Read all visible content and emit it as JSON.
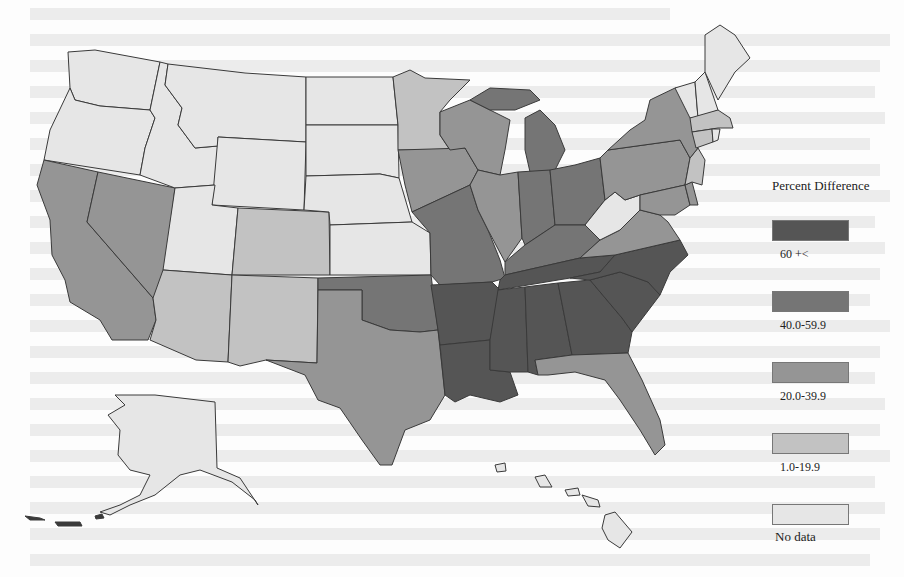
{
  "document": {
    "type": "scanned-page",
    "figure": "choropleth-map-united-states"
  },
  "legend": {
    "title": "Percent Difference",
    "items": [
      {
        "label": "60 +<",
        "color": "#555555",
        "class": "c60"
      },
      {
        "label": "40.0-59.9",
        "color": "#757575",
        "class": "c40"
      },
      {
        "label": "20.0-39.9",
        "color": "#959595",
        "class": "c20"
      },
      {
        "label": "1.0-19.9",
        "color": "#c2c2c2",
        "class": "c1"
      },
      {
        "label": "No data",
        "color": "#e6e6e6",
        "class": "nd"
      }
    ]
  },
  "map": {
    "region": "United States",
    "states": {
      "WA": "No data",
      "OR": "No data",
      "ID": "No data",
      "MT": "No data",
      "WY": "No data",
      "UT": "No data",
      "ND": "No data",
      "SD": "No data",
      "NE": "No data",
      "KS": "No data",
      "WV": "No data",
      "ME": "No data",
      "NH": "No data",
      "VT": "No data",
      "RI": "No data",
      "AK": "No data",
      "HI": "No data",
      "MN": "1.0-19.9",
      "CO": "1.0-19.9",
      "NM": "1.0-19.9",
      "AZ": "1.0-19.9",
      "MA": "1.0-19.9",
      "CT": "1.0-19.9",
      "NJ": "1.0-19.9",
      "CA": "20.0-39.9",
      "NV": "20.0-39.9",
      "TX": "20.0-39.9",
      "IA": "20.0-39.9",
      "WI": "20.0-39.9",
      "IL": "20.0-39.9",
      "FL": "20.0-39.9",
      "VA": "20.0-39.9",
      "NY": "20.0-39.9",
      "PA": "20.0-39.9",
      "MD": "20.0-39.9",
      "DE": "20.0-39.9",
      "MO": "40.0-59.9",
      "OK": "40.0-59.9",
      "MI": "40.0-59.9",
      "IN": "40.0-59.9",
      "OH": "40.0-59.9",
      "KY": "40.0-59.9",
      "AR": "60 +<",
      "LA": "60 +<",
      "MS": "60 +<",
      "AL": "60 +<",
      "TN": "60 +<",
      "GA": "60 +<",
      "SC": "60 +<",
      "NC": "60 +<"
    }
  }
}
